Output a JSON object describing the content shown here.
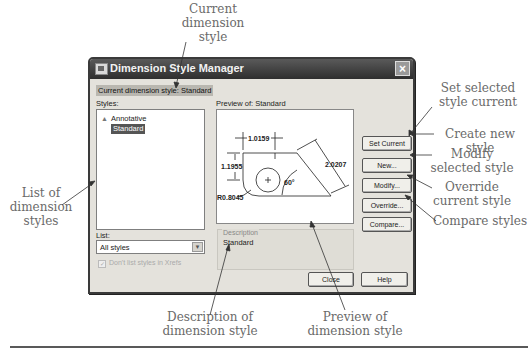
{
  "dialog": {
    "title": "Dimension Style Manager",
    "close_icon": "×",
    "current_style_label": "Current dimension style: Standard",
    "styles_label": "Styles:",
    "styles": [
      {
        "name": "Annotative",
        "icon": "annotative-icon",
        "selected": false
      },
      {
        "name": "Standard",
        "selected": true
      }
    ],
    "list_label": "List:",
    "list_value": "All styles",
    "xref_checkbox_label": "Don't list styles in Xrefs",
    "xref_checked": true,
    "preview_label": "Preview of: Standard",
    "preview": {
      "dim_top": "1.0159",
      "dim_left": "1.1955",
      "dim_angled": "2.0207",
      "angle": "60°",
      "radius": "R0.8045"
    },
    "description_group_label": "Description",
    "description_value": "Standard",
    "buttons": {
      "set_current": "Set Current",
      "new": "New...",
      "modify": "Modify...",
      "override": "Override...",
      "compare": "Compare...",
      "close": "Close",
      "help": "Help"
    }
  },
  "callouts": {
    "current_style": [
      "Current",
      "dimension",
      "style"
    ],
    "set_current": [
      "Set selected",
      "style current"
    ],
    "create_new": [
      "Create new style"
    ],
    "modify": [
      "Modify",
      "selected style"
    ],
    "override": [
      "Override",
      "current style"
    ],
    "compare": [
      "Compare styles"
    ],
    "list_styles": [
      "List of",
      "dimension",
      "styles"
    ],
    "description": [
      "Description of",
      "dimension style"
    ],
    "preview": [
      "Preview of",
      "dimension style"
    ]
  },
  "colors": {
    "titlebar": "#3a3a3a",
    "dialog_bg": "#e4e2dc",
    "selection": "#555555",
    "callout_text": "#6a6a6a"
  }
}
